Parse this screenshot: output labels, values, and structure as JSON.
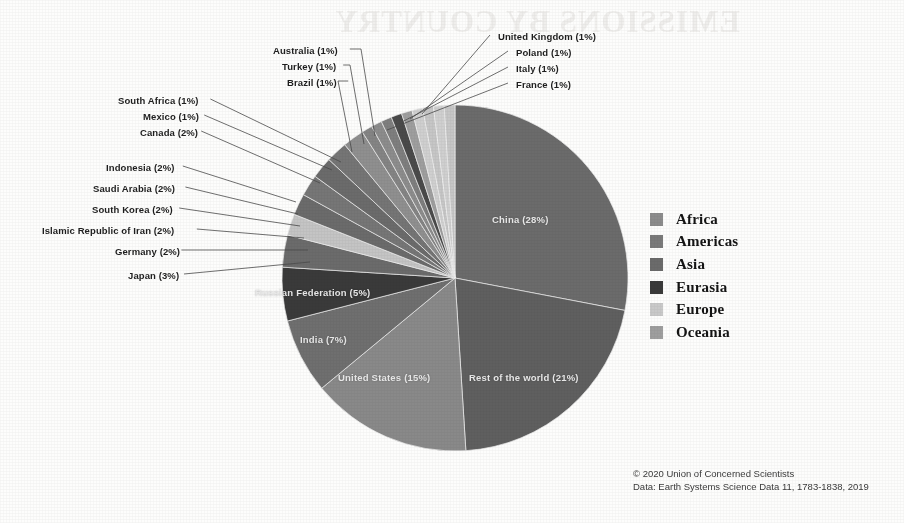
{
  "credit": {
    "line1": "© 2020 Union of Concerned Scientists",
    "line2": "Data: Earth Systems Science Data 11, 1783-1838, 2019"
  },
  "watermark": {
    "text1": "EMISSIONS BY COUNTRY",
    "text2": "each country"
  },
  "legend": {
    "title": "Region",
    "items": [
      {
        "label": "Africa",
        "color": "#8c8c8c"
      },
      {
        "label": "Americas",
        "color": "#7a7a7a"
      },
      {
        "label": "Asia",
        "color": "#6b6b6b"
      },
      {
        "label": "Eurasia",
        "color": "#3a3a3a"
      },
      {
        "label": "Europe",
        "color": "#c9c9c9"
      },
      {
        "label": "Oceania",
        "color": "#9e9e9e"
      }
    ]
  },
  "chart_data": {
    "type": "pie",
    "title": "",
    "units": "percent of global CO2 emissions",
    "start_angle_deg": 0,
    "legend_position": "right",
    "center": {
      "cx": 455,
      "cy": 278,
      "r": 173
    },
    "regions": {
      "Africa": "#8c8c8c",
      "Americas": "#7a7a7a",
      "Asia": "#6b6b6b",
      "Eurasia": "#3a3a3a",
      "Europe": "#c9c9c9",
      "Oceania": "#9e9e9e"
    },
    "slices": [
      {
        "name": "China",
        "label": "China (28%)",
        "value": 28,
        "region": "Asia",
        "color": "#6b6b6b",
        "direction": "cw",
        "inside": true,
        "label_x": 492,
        "label_y": 214
      },
      {
        "name": "Rest of the world",
        "label": "Rest of the world (21%)",
        "value": 21,
        "region": "Asia",
        "color": "#5f5f5f",
        "direction": "cw",
        "inside": true,
        "label_x": 469,
        "label_y": 372
      },
      {
        "name": "United States",
        "label": "United States (15%)",
        "value": 15,
        "region": "Americas",
        "color": "#898989",
        "direction": "cw",
        "inside": true,
        "label_x": 338,
        "label_y": 372
      },
      {
        "name": "India",
        "label": "India (7%)",
        "value": 7,
        "region": "Asia",
        "color": "#6f6f6f",
        "direction": "cw",
        "inside": true,
        "label_x": 300,
        "label_y": 334
      },
      {
        "name": "Russian Federation",
        "label": "Russian Federation (5%)",
        "value": 5,
        "region": "Eurasia",
        "color": "#3a3a3a",
        "direction": "cw",
        "inside": true,
        "label_x": 255,
        "label_y": 287
      },
      {
        "name": "Japan",
        "label": "Japan (3%)",
        "value": 3,
        "region": "Asia",
        "color": "#6b6b6b",
        "direction": "cw",
        "inside": false,
        "side": "left",
        "label_x": 128,
        "label_y": 270,
        "anchor_x": 310,
        "anchor_y": 262
      },
      {
        "name": "Germany",
        "label": "Germany (2%)",
        "value": 2,
        "region": "Europe",
        "color": "#c4c4c4",
        "direction": "cw",
        "inside": false,
        "side": "left",
        "label_x": 115,
        "label_y": 246,
        "anchor_x": 308,
        "anchor_y": 250
      },
      {
        "name": "Islamic Republic of Iran",
        "label": "Islamic Republic of Iran (2%)",
        "value": 2,
        "region": "Asia",
        "color": "#6b6b6b",
        "direction": "cw",
        "inside": false,
        "side": "left",
        "label_x": 42,
        "label_y": 225,
        "anchor_x": 304,
        "anchor_y": 238
      },
      {
        "name": "South Korea",
        "label": "South Korea (2%)",
        "value": 2,
        "region": "Asia",
        "color": "#767676",
        "direction": "cw",
        "inside": false,
        "side": "left",
        "label_x": 92,
        "label_y": 204,
        "anchor_x": 300,
        "anchor_y": 226
      },
      {
        "name": "Saudi Arabia",
        "label": "Saudi Arabia (2%)",
        "value": 2,
        "region": "Asia",
        "color": "#6b6b6b",
        "direction": "cw",
        "inside": false,
        "side": "left",
        "label_x": 93,
        "label_y": 183,
        "anchor_x": 298,
        "anchor_y": 214
      },
      {
        "name": "Indonesia",
        "label": "Indonesia (2%)",
        "value": 2,
        "region": "Asia",
        "color": "#757575",
        "direction": "cw",
        "inside": false,
        "side": "left",
        "label_x": 106,
        "label_y": 162,
        "anchor_x": 296,
        "anchor_y": 202
      },
      {
        "name": "Canada",
        "label": "Canada (2%)",
        "value": 2,
        "region": "Americas",
        "color": "#8f8f8f",
        "direction": "cw",
        "inside": false,
        "side": "left",
        "label_x": 140,
        "label_y": 127,
        "anchor_x": 320,
        "anchor_y": 183
      },
      {
        "name": "Mexico",
        "label": "Mexico (1%)",
        "value": 1,
        "region": "Americas",
        "color": "#848484",
        "direction": "cw",
        "inside": false,
        "side": "left",
        "label_x": 143,
        "label_y": 111,
        "anchor_x": 332,
        "anchor_y": 170
      },
      {
        "name": "South Africa",
        "label": "South Africa (1%)",
        "value": 1,
        "region": "Africa",
        "color": "#8c8c8c",
        "direction": "cw",
        "inside": false,
        "side": "left",
        "label_x": 118,
        "label_y": 95,
        "anchor_x": 341,
        "anchor_y": 162
      },
      {
        "name": "Brazil",
        "label": "Brazil (1%)",
        "value": 1,
        "region": "Americas",
        "color": "#7e7e7e",
        "direction": "cw",
        "inside": false,
        "side": "top",
        "label_x": 287,
        "label_y": 77,
        "anchor_x": 352,
        "anchor_y": 152
      },
      {
        "name": "Turkey",
        "label": "Turkey (1%)",
        "value": 1,
        "region": "Eurasia",
        "color": "#4a4a4a",
        "direction": "cw",
        "inside": false,
        "side": "top",
        "label_x": 282,
        "label_y": 61,
        "anchor_x": 364,
        "anchor_y": 144
      },
      {
        "name": "Australia",
        "label": "Australia (1%)",
        "value": 1,
        "region": "Oceania",
        "color": "#9e9e9e",
        "direction": "cw",
        "inside": false,
        "side": "top",
        "label_x": 273,
        "label_y": 45,
        "anchor_x": 375,
        "anchor_y": 136
      },
      {
        "name": "France",
        "label": "France (1%)",
        "value": 1,
        "region": "Europe",
        "color": "#cfcfcf",
        "direction": "cw",
        "inside": false,
        "side": "right",
        "label_x": 516,
        "label_y": 79,
        "anchor_x": 387,
        "anchor_y": 130
      },
      {
        "name": "Italy",
        "label": "Italy (1%)",
        "value": 1,
        "region": "Europe",
        "color": "#c6c6c6",
        "direction": "cw",
        "inside": false,
        "side": "right",
        "label_x": 516,
        "label_y": 63,
        "anchor_x": 398,
        "anchor_y": 124
      },
      {
        "name": "Poland",
        "label": "Poland (1%)",
        "value": 1,
        "region": "Europe",
        "color": "#cfcfcf",
        "direction": "cw",
        "inside": false,
        "side": "right",
        "label_x": 516,
        "label_y": 47,
        "anchor_x": 410,
        "anchor_y": 119
      },
      {
        "name": "United Kingdom",
        "label": "United Kingdom (1%)",
        "value": 1,
        "region": "Europe",
        "color": "#c6c6c6",
        "direction": "cw",
        "inside": false,
        "side": "right",
        "label_x": 498,
        "label_y": 31,
        "anchor_x": 422,
        "anchor_y": 114
      }
    ]
  }
}
